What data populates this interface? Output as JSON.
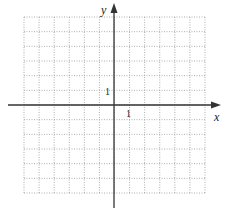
{
  "diagram": {
    "type": "coordinate-grid",
    "axes": {
      "x_label": "x",
      "y_label": "y",
      "x_tick_label": "1",
      "y_tick_label": "1"
    },
    "grid": {
      "columns": 12,
      "rows": 12,
      "x_range": [
        -6,
        6
      ],
      "y_range": [
        -6,
        6
      ],
      "line_style": "dotted"
    },
    "colors": {
      "grid": "#9a9a9a",
      "axis": "#333333",
      "background": "#ffffff"
    }
  }
}
